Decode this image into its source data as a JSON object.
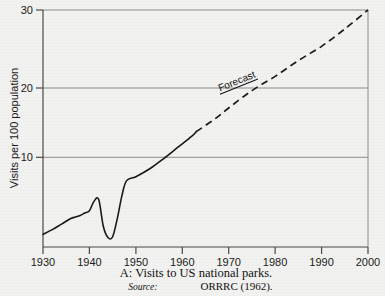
{
  "chart_data": {
    "type": "line",
    "title": "",
    "xlabel": "",
    "ylabel": "Visits per 100 population",
    "xlim": [
      1930,
      2000
    ],
    "ylim": [
      0,
      30
    ],
    "grid": "horizontal",
    "legend_position": "none",
    "x_ticks": [
      1930,
      1940,
      1950,
      1960,
      1970,
      1980,
      1990,
      2000
    ],
    "x_tick_labels": [
      "1930",
      "1940",
      "1950",
      "1960",
      "1970",
      "1980",
      "1990",
      "2000"
    ],
    "y_ticks": [
      10,
      20,
      30
    ],
    "y_tick_labels": [
      "10",
      "20",
      "30"
    ],
    "annotations": [
      {
        "text": "Forecast",
        "x": 1972,
        "y": 20.6,
        "rotation_deg": -22,
        "underlined": true
      }
    ],
    "series": [
      {
        "name": "Actual visits",
        "style": "solid",
        "x": [
          1930,
          1932,
          1934,
          1936,
          1937,
          1938,
          1939,
          1940,
          1941,
          1942,
          1943,
          1944,
          1945,
          1946,
          1947,
          1948,
          1950,
          1953,
          1956,
          1959,
          1962,
          1963
        ],
        "values": [
          1.6,
          2.2,
          2.9,
          3.6,
          3.8,
          4.0,
          4.3,
          4.6,
          5.8,
          6.0,
          2.6,
          1.2,
          1.3,
          3.6,
          6.5,
          8.4,
          8.9,
          9.9,
          11.2,
          12.6,
          14.0,
          14.6
        ]
      },
      {
        "name": "Forecast visits",
        "style": "dashed",
        "x": [
          1963,
          1967,
          1970,
          1975,
          1980,
          1985,
          1990,
          1995,
          2000
        ],
        "values": [
          14.6,
          16.2,
          17.6,
          19.8,
          21.6,
          23.6,
          25.4,
          27.6,
          30.0
        ]
      }
    ]
  },
  "caption": {
    "line1": "A: Visits to US national parks.",
    "source_label": "Source:",
    "source_value": "ORRRC (1962)."
  }
}
